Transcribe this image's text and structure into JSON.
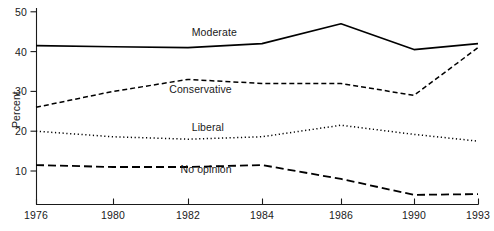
{
  "chart_data": {
    "type": "line",
    "title": "",
    "subtitle": "",
    "xlabel": "",
    "ylabel": "Percent",
    "x": [
      1976,
      1980,
      1982,
      1984,
      1986,
      1990,
      1993
    ],
    "x_tick_labels": [
      "1976",
      "1980",
      "1982",
      "1984",
      "1986",
      "1990",
      "1993"
    ],
    "y_tick_labels": [
      "10",
      "20",
      "30",
      "40",
      "50"
    ],
    "y_ticks": [
      10,
      20,
      30,
      40,
      50
    ],
    "ylim": [
      0,
      50
    ],
    "grid": false,
    "legend": "inline-labels",
    "series": [
      {
        "name": "Moderate",
        "style": "solid",
        "color": "#000000",
        "values": [
          41.5,
          41.2,
          41.0,
          42.0,
          47.0,
          40.5,
          42.0
        ],
        "label_x": 1982.1,
        "label_y": 45.0
      },
      {
        "name": "Conservative",
        "style": "dashed",
        "color": "#000000",
        "values": [
          26.0,
          30.0,
          33.0,
          32.0,
          32.0,
          29.0,
          41.0
        ],
        "label_x": 1981.5,
        "label_y": 30.5
      },
      {
        "name": "Liberal",
        "style": "dotted",
        "color": "#000000",
        "values": [
          20.0,
          18.6,
          18.0,
          18.6,
          21.5,
          19.2,
          17.5
        ],
        "label_x": 1982.1,
        "label_y": 21.0
      },
      {
        "name": "No opinion",
        "style": "long-dashed",
        "color": "#000000",
        "values": [
          11.5,
          11.0,
          11.0,
          11.5,
          8.0,
          4.0,
          4.2
        ],
        "label_x": 1981.8,
        "label_y": 10.5
      }
    ]
  },
  "axes": {
    "y_title": "Percent"
  }
}
